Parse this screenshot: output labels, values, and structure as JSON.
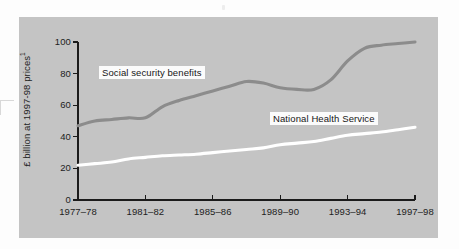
{
  "chart_data": {
    "type": "line",
    "title": "",
    "subtitle": "",
    "xlabel": "",
    "ylabel": "£ billion at 1997-98 prices",
    "ylabel_superscript": "1",
    "xlim": [
      1977,
      1997
    ],
    "ylim": [
      0,
      100
    ],
    "grid": false,
    "legend_position": "inline-annotation",
    "x_tick_labels": [
      "1977–78",
      "1981–82",
      "1985–86",
      "1989–90",
      "1993–94",
      "1997–98"
    ],
    "x_tick_values": [
      1977,
      1981,
      1985,
      1989,
      1993,
      1997
    ],
    "y_tick_labels": [
      "0",
      "20",
      "40",
      "60",
      "80",
      "100"
    ],
    "y_tick_values": [
      0,
      20,
      40,
      60,
      80,
      100
    ],
    "x": [
      1977,
      1978,
      1979,
      1980,
      1981,
      1982,
      1983,
      1984,
      1985,
      1986,
      1987,
      1988,
      1989,
      1990,
      1991,
      1992,
      1993,
      1994,
      1995,
      1996,
      1997
    ],
    "x_labels": [
      "1977–78",
      "1978–79",
      "1979–80",
      "1980–81",
      "1981–82",
      "1982–83",
      "1983–84",
      "1984–85",
      "1985–86",
      "1986–87",
      "1987–88",
      "1988–89",
      "1989–90",
      "1990–91",
      "1991–92",
      "1992–93",
      "1993–94",
      "1994–95",
      "1995–96",
      "1996–97",
      "1997–98"
    ],
    "series": [
      {
        "name": "Social security benefits",
        "color": "#8c8c8c",
        "stroke_width": 3.1,
        "values": [
          47,
          50,
          51,
          52,
          52,
          59,
          63,
          66,
          69,
          72,
          75,
          74,
          71,
          70,
          70,
          76,
          88,
          96,
          98,
          99,
          100
        ]
      },
      {
        "name": "National Health Service",
        "color": "#ffffff",
        "stroke_width": 3.1,
        "values": [
          22,
          23,
          24,
          26,
          27,
          28,
          28.5,
          29,
          30,
          31,
          32,
          33,
          35,
          36,
          37,
          39,
          41,
          42,
          43,
          44.5,
          46
        ]
      }
    ],
    "annotations": [
      {
        "text": "Social security benefits",
        "series": "Social security benefits"
      },
      {
        "text": "National Health Service",
        "series": "National Health Service"
      }
    ]
  },
  "colors": {
    "page_background": "#fdfdfd",
    "panel_background": "#c4c4c4",
    "axis": "#1b1b1b",
    "text": "#1d1d1d",
    "label_box_background": "#fbfbfb",
    "social_security_line": "#8c8c8c",
    "nhs_line": "#ffffff"
  }
}
